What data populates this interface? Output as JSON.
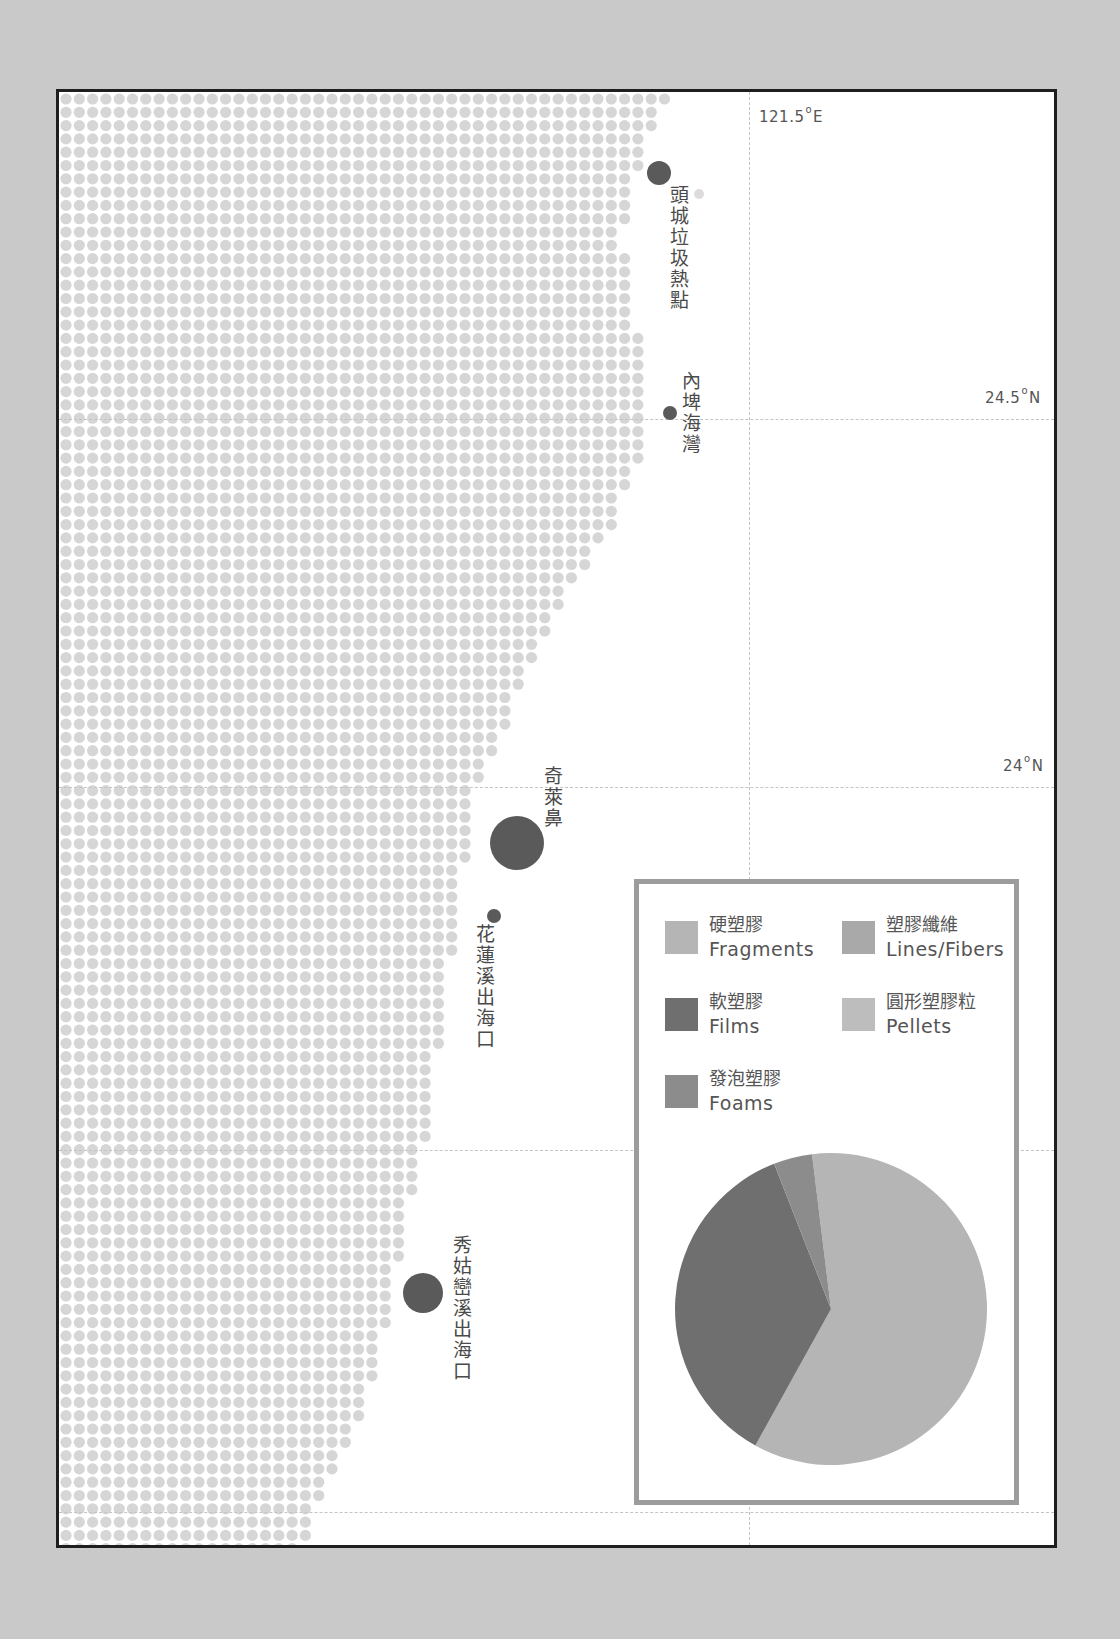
{
  "map": {
    "longitude_label": "121.5",
    "longitude_suffix": "E",
    "lat_labels": [
      {
        "value": "24.5",
        "suffix": "N"
      },
      {
        "value": "24",
        "suffix": "N"
      }
    ],
    "colors": {
      "land_dot": "#d6d6d6",
      "marker": "#5a5a5a",
      "frame": "#1e1e1e",
      "page_bg": "#c9c9c9"
    },
    "sites": [
      {
        "name": "頭城垃圾熱點",
        "size": "medium"
      },
      {
        "name": "內埤海灣",
        "size": "small"
      },
      {
        "name": "奇萊鼻",
        "size": "large"
      },
      {
        "name": "花蓮溪出海口",
        "size": "small"
      },
      {
        "name": "秀姑巒溪出海口",
        "size": "medium"
      }
    ],
    "coastline": [
      [
        6,
        609
      ],
      [
        21,
        598
      ],
      [
        61,
        584
      ],
      [
        96,
        572
      ],
      [
        141,
        564
      ],
      [
        211,
        569
      ],
      [
        261,
        584
      ],
      [
        311,
        584
      ],
      [
        357,
        587
      ],
      [
        431,
        554
      ],
      [
        511,
        504
      ],
      [
        611,
        454
      ],
      [
        671,
        431
      ],
      [
        711,
        414
      ],
      [
        791,
        404
      ],
      [
        861,
        394
      ],
      [
        961,
        379
      ],
      [
        1061,
        364
      ],
      [
        1111,
        349
      ],
      [
        1211,
        334
      ],
      [
        1311,
        309
      ],
      [
        1361,
        284
      ],
      [
        1421,
        254
      ],
      [
        1459,
        244
      ]
    ]
  },
  "legend": {
    "items": [
      {
        "zh": "硬塑膠",
        "en": "Fragments",
        "color": "#b5b5b5"
      },
      {
        "zh": "塑膠纖維",
        "en": "Lines/Fibers",
        "color": "#a9a9a9"
      },
      {
        "zh": "軟塑膠",
        "en": "Films",
        "color": "#6f6f6f"
      },
      {
        "zh": "圓形塑膠粒",
        "en": "Pellets",
        "color": "#bdbdbd"
      },
      {
        "zh": "發泡塑膠",
        "en": "Foams",
        "color": "#8c8c8c"
      }
    ]
  },
  "chart_data": {
    "type": "pie",
    "title": "",
    "categories": [
      "Fragments",
      "Films",
      "Foams",
      "Lines/Fibers",
      "Pellets"
    ],
    "labels_zh": [
      "硬塑膠",
      "軟塑膠",
      "發泡塑膠",
      "塑膠纖維",
      "圓形塑膠粒"
    ],
    "values": [
      60,
      36,
      4,
      0,
      0
    ],
    "unit": "%",
    "start_angle_deg": -7,
    "direction": "clockwise",
    "legend_position": "top, inside box"
  }
}
